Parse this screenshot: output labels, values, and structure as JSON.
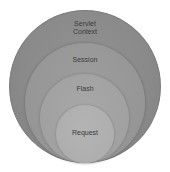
{
  "diagram": {
    "type": "nested-circles",
    "circles": [
      {
        "label_line1": "Servlet",
        "label_line2": "Context",
        "color": "#8a8a8a"
      },
      {
        "label": "Session",
        "color": "#969696"
      },
      {
        "label": "Flash",
        "color": "#a1a1a1"
      },
      {
        "label": "Request",
        "color": "#aeaeae"
      }
    ],
    "label_color": "#3a3a3a",
    "background": "#ffffff"
  }
}
